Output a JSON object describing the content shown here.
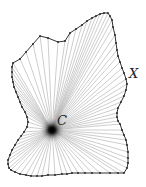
{
  "figure": {
    "type": "star-shaped region with rays from center",
    "center_label": "C",
    "boundary_label": "X",
    "center": [
      52,
      130
    ],
    "center_label_pos": [
      57,
      125
    ],
    "boundary_label_pos": [
      129,
      78
    ],
    "colors": {
      "boundary": "#333333",
      "rays": "#9a9a9a",
      "vertex": "#222222",
      "center_glow": "#000000",
      "background": "#ffffff"
    },
    "boundary_points": [
      [
        13,
        63
      ],
      [
        20,
        59
      ],
      [
        26,
        52
      ],
      [
        33,
        44
      ],
      [
        40,
        36
      ],
      [
        48,
        38
      ],
      [
        58,
        42
      ],
      [
        65,
        41
      ],
      [
        70,
        33
      ],
      [
        76,
        29
      ],
      [
        82,
        25
      ],
      [
        87,
        21
      ],
      [
        92,
        18
      ],
      [
        96,
        16
      ],
      [
        100,
        14
      ],
      [
        104,
        13
      ],
      [
        108,
        13
      ],
      [
        110,
        16
      ],
      [
        112,
        20
      ],
      [
        113,
        27
      ],
      [
        115,
        35
      ],
      [
        116,
        43
      ],
      [
        117,
        50
      ],
      [
        118,
        56
      ],
      [
        120,
        62
      ],
      [
        122,
        68
      ],
      [
        124,
        73
      ],
      [
        126,
        79
      ],
      [
        127,
        84
      ],
      [
        126,
        90
      ],
      [
        124,
        96
      ],
      [
        121,
        102
      ],
      [
        118,
        108
      ],
      [
        117,
        113
      ],
      [
        117,
        117
      ],
      [
        118,
        121
      ],
      [
        120,
        124
      ],
      [
        122,
        130
      ],
      [
        124,
        135
      ],
      [
        126,
        140
      ],
      [
        127,
        145
      ],
      [
        128,
        152
      ],
      [
        128,
        158
      ],
      [
        128,
        163
      ],
      [
        127,
        168
      ],
      [
        124,
        173
      ],
      [
        118,
        173
      ],
      [
        110,
        173
      ],
      [
        100,
        173
      ],
      [
        92,
        173
      ],
      [
        85,
        173
      ],
      [
        78,
        173
      ],
      [
        72,
        173
      ],
      [
        67,
        174
      ],
      [
        62,
        174
      ],
      [
        55,
        175
      ],
      [
        48,
        175
      ],
      [
        42,
        176
      ],
      [
        37,
        176
      ],
      [
        31,
        176
      ],
      [
        26,
        175
      ],
      [
        20,
        174
      ],
      [
        15,
        172
      ],
      [
        11,
        170
      ],
      [
        9,
        168
      ],
      [
        8,
        164
      ],
      [
        8,
        160
      ],
      [
        10,
        155
      ],
      [
        12,
        150
      ],
      [
        15,
        145
      ],
      [
        18,
        140
      ],
      [
        21,
        136
      ],
      [
        24,
        132
      ],
      [
        27,
        127
      ],
      [
        28,
        122
      ],
      [
        27,
        117
      ],
      [
        25,
        112
      ],
      [
        22,
        107
      ],
      [
        20,
        102
      ],
      [
        18,
        97
      ],
      [
        16,
        92
      ],
      [
        14,
        87
      ],
      [
        13,
        82
      ],
      [
        12,
        77
      ],
      [
        12,
        72
      ],
      [
        12,
        67
      ]
    ]
  }
}
